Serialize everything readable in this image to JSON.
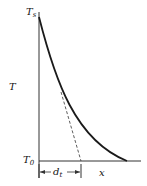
{
  "diagram": {
    "labels": {
      "y_axis": "T",
      "x_axis": "x",
      "top": {
        "main": "T",
        "sub": "s"
      },
      "bottom": {
        "main": "T",
        "sub": "0"
      },
      "thickness": {
        "main": "d",
        "sub": "t"
      }
    },
    "colors": {
      "line": "#1a1a1a",
      "background": "#ffffff"
    }
  }
}
